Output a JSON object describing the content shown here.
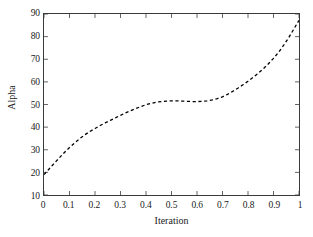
{
  "chart_data": {
    "type": "line",
    "title": "",
    "xlabel": "Iteration",
    "ylabel": "Alpha",
    "xlim": [
      0,
      1
    ],
    "ylim": [
      10,
      90
    ],
    "xticks": [
      "0",
      "0.1",
      "0.2",
      "0.3",
      "0.4",
      "0.5",
      "0.6",
      "0.7",
      "0.8",
      "0.9",
      "1"
    ],
    "xtick_values": [
      0,
      0.1,
      0.2,
      0.3,
      0.4,
      0.5,
      0.6,
      0.7,
      0.8,
      0.9,
      1
    ],
    "yticks": [
      "10",
      "20",
      "30",
      "40",
      "50",
      "60",
      "70",
      "80",
      "90"
    ],
    "ytick_values": [
      10,
      20,
      30,
      40,
      50,
      60,
      70,
      80,
      90
    ],
    "grid": false,
    "legend": null,
    "series": [
      {
        "name": "Alpha",
        "style": "dashed",
        "color": "#000000",
        "linewidth": 1.3,
        "x": [
          0.0,
          0.02,
          0.04,
          0.06,
          0.08,
          0.1,
          0.12,
          0.14,
          0.16,
          0.18,
          0.2,
          0.22,
          0.24,
          0.26,
          0.28,
          0.3,
          0.32,
          0.34,
          0.36,
          0.38,
          0.4,
          0.42,
          0.44,
          0.46,
          0.48,
          0.5,
          0.52,
          0.54,
          0.56,
          0.58,
          0.6,
          0.62,
          0.64,
          0.66,
          0.68,
          0.7,
          0.72,
          0.74,
          0.76,
          0.78,
          0.8,
          0.82,
          0.84,
          0.86,
          0.88,
          0.9,
          0.92,
          0.94,
          0.96,
          0.98,
          1.0
        ],
        "y": [
          19.0,
          21.5,
          24.0,
          26.4,
          28.8,
          31.0,
          33.0,
          34.9,
          36.6,
          38.1,
          39.4,
          40.7,
          41.9,
          43.0,
          44.1,
          45.2,
          46.3,
          47.3,
          48.2,
          49.1,
          49.9,
          50.5,
          51.0,
          51.3,
          51.5,
          51.6,
          51.6,
          51.5,
          51.4,
          51.3,
          51.3,
          51.4,
          51.6,
          52.0,
          52.6,
          53.4,
          54.5,
          55.8,
          57.2,
          58.7,
          60.3,
          62.0,
          63.8,
          65.8,
          68.0,
          70.4,
          73.1,
          76.2,
          79.6,
          83.4,
          87.2
        ]
      }
    ]
  },
  "axis": {
    "ylabel": "Alpha",
    "xlabel": "Iteration"
  }
}
